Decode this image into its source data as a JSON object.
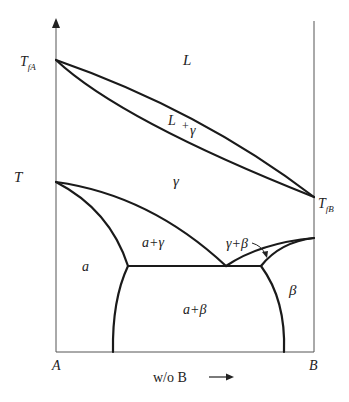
{
  "diagram": {
    "type": "binary-phase-diagram",
    "y_axis_label": "T",
    "x_axis_label": "w/o B",
    "left_component": "A",
    "right_component": "B",
    "melting_point_A": {
      "main": "T",
      "sub": "fA"
    },
    "melting_point_B": {
      "main": "T",
      "sub": "fB"
    },
    "regions": {
      "liquid": "L",
      "liquid_gamma": "L + γ",
      "gamma": "γ",
      "alpha": "a",
      "alpha_gamma": "a+γ",
      "gamma_beta": "γ+β",
      "alpha_beta": "a+β",
      "beta": "β"
    },
    "colors": {
      "line": "#1a1a1a",
      "axis": "#555555",
      "text": "#222222"
    }
  }
}
